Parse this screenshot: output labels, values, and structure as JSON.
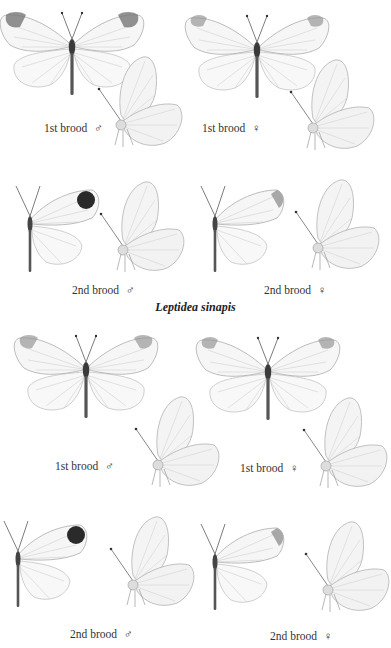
{
  "plate": {
    "species_title": "Leptidea sinapis",
    "colors": {
      "background": "#ffffff",
      "wing": "#f4f4f4",
      "wing_edge": "#9a9a9a",
      "apex_light": "#8a8a8a",
      "apex_dark": "#2a2a2a",
      "body": "#555555",
      "text": "#333333"
    },
    "upper_set": {
      "figures": [
        {
          "label": "1st brood",
          "sex_symbol": "♂"
        },
        {
          "label": "1st brood",
          "sex_symbol": "♀"
        },
        {
          "label": "2nd brood",
          "sex_symbol": "♂"
        },
        {
          "label": "2nd brood",
          "sex_symbol": "♀"
        }
      ]
    },
    "lower_set": {
      "figures": [
        {
          "label": "1st brood",
          "sex_symbol": "♂"
        },
        {
          "label": "1st brood",
          "sex_symbol": "♀"
        },
        {
          "label": "2nd brood",
          "sex_symbol": "♂"
        },
        {
          "label": "2nd brood",
          "sex_symbol": "♀"
        }
      ]
    }
  }
}
